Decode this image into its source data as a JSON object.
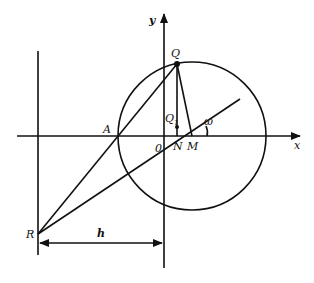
{
  "diagram": {
    "labels": {
      "y_axis": "y",
      "x_axis": "x",
      "Q": "Q",
      "Q1": "Q",
      "Q1_sub": "1",
      "A": "A",
      "origin": "0",
      "N": "N",
      "M": "M",
      "omega": "ω",
      "R": "R",
      "h": "h"
    },
    "colors": {
      "stroke": "#111111",
      "background": "#ffffff"
    }
  }
}
